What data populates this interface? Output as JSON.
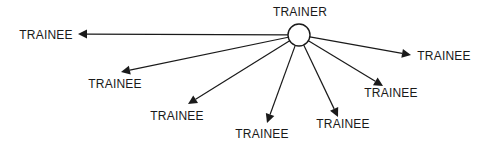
{
  "diagram": {
    "type": "hub-and-spoke",
    "colors": {
      "line": "#1a1a1a",
      "background": "#ffffff",
      "hub_fill": "#ffffff"
    },
    "hub": {
      "label": "TRAINER",
      "cx": 299,
      "cy": 35,
      "r": 11,
      "label_x": 300,
      "label_y": 16
    },
    "nodes": [
      {
        "label": "TRAINEE",
        "tip_x": 78,
        "tip_y": 34,
        "label_x": 46,
        "label_y": 39
      },
      {
        "label": "TRAINEE",
        "tip_x": 121,
        "tip_y": 72,
        "label_x": 115,
        "label_y": 88
      },
      {
        "label": "TRAINEE",
        "tip_x": 188,
        "tip_y": 104,
        "label_x": 177,
        "label_y": 120
      },
      {
        "label": "TRAINEE",
        "tip_x": 267,
        "tip_y": 123,
        "label_x": 262,
        "label_y": 138
      },
      {
        "label": "TRAINEE",
        "tip_x": 338,
        "tip_y": 117,
        "label_x": 343,
        "label_y": 128
      },
      {
        "label": "TRAINEE",
        "tip_x": 383,
        "tip_y": 86,
        "label_x": 391,
        "label_y": 97
      },
      {
        "label": "TRAINEE",
        "tip_x": 411,
        "tip_y": 55,
        "label_x": 444,
        "label_y": 60
      }
    ]
  }
}
